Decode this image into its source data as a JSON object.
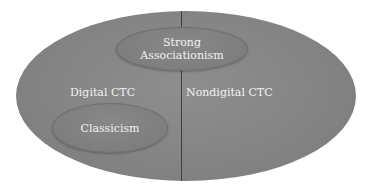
{
  "diagram": {
    "type": "nested-ellipse (venn-like) diagram",
    "colors": {
      "background": "#ffffff",
      "outer_ellipse": "#848484",
      "inner_ellipse": "#7e7e7e",
      "divider_line": "#3e3e3e",
      "text": "#f2f2f2"
    },
    "regions": {
      "left": {
        "label": "Digital CTC"
      },
      "right": {
        "label": "Nondigital CTC"
      }
    },
    "inner_ellipses": {
      "strong_associationism": {
        "line1": "Strong",
        "line2": "Associationism",
        "spans": "both regions (top, crossing divider)"
      },
      "classicism": {
        "label": "Classicism",
        "within": "Digital CTC"
      }
    }
  }
}
